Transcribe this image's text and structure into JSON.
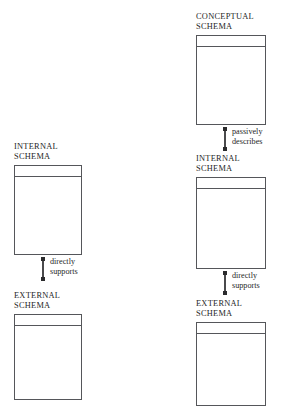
{
  "diagram": {
    "background_color": "#ffffff",
    "box_border_color": "#55565a",
    "connector_color": "#4a4a4c",
    "connector_cap_color": "#2b2b2d",
    "text_color": "#1f1f1f",
    "columns": [
      {
        "name": "two-level-architecture",
        "nodes": [
          {
            "id": "left-internal-schema",
            "label": "INTERNAL\nSCHEMA",
            "x": 14,
            "y_label": 142,
            "y_box": 168,
            "width": 68,
            "height": 90
          },
          {
            "id": "left-external-schema",
            "label": "EXTERNAL\nSCHEMA",
            "x": 14,
            "y_label": 291,
            "y_box": 317,
            "width": 68,
            "height": 86
          }
        ],
        "connectors": [
          {
            "id": "left-internal-to-external",
            "label": "directly\nsupports",
            "x": 42,
            "y": 258,
            "length": 22
          }
        ]
      },
      {
        "name": "three-level-architecture",
        "nodes": [
          {
            "id": "right-conceptual-schema",
            "label": "CONCEPTUAL\nSCHEMA",
            "x": 196,
            "y_label": 12,
            "y_box": 38,
            "width": 70,
            "height": 90
          },
          {
            "id": "right-internal-schema",
            "label": "INTERNAL\nSCHEMA",
            "x": 196,
            "y_label": 154,
            "y_box": 180,
            "width": 70,
            "height": 92
          },
          {
            "id": "right-external-schema",
            "label": "EXTERNAL\nSCHEMA",
            "x": 196,
            "y_label": 299,
            "y_box": 324,
            "width": 70,
            "height": 84
          }
        ],
        "connectors": [
          {
            "id": "right-conceptual-to-internal",
            "label": "passively\ndescribes",
            "x": 224,
            "y": 128,
            "length": 22
          },
          {
            "id": "right-internal-to-external",
            "label": "directly\nsupports",
            "x": 224,
            "y": 272,
            "length": 22
          }
        ]
      }
    ]
  }
}
